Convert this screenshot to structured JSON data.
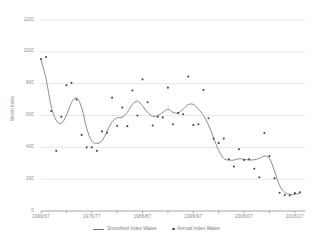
{
  "chart_data": {
    "type": "line",
    "title": "",
    "xlabel": "",
    "ylabel": "Welsh Index",
    "ylim": [
      0,
      1200
    ],
    "ytick_labels": [
      "1200",
      "1000",
      "800",
      "600",
      "400",
      "200",
      "0"
    ],
    "ytick_values": [
      1200,
      1000,
      800,
      600,
      400,
      200,
      0
    ],
    "xtick_labels": [
      "1966/67",
      "1976/77",
      "1986/87",
      "1996/97",
      "2006/07",
      "2016/17"
    ],
    "xtick_values": [
      1966,
      1976,
      1986,
      1996,
      2006,
      2016
    ],
    "xlim": [
      1966,
      2018
    ],
    "grid": "horizontal",
    "legend_position": "bottom",
    "series": [
      {
        "name": "Annual Index Wales",
        "marker": "dot",
        "color": "#4a4a4a",
        "x": [
          1966,
          1967,
          1968,
          1969,
          1970,
          1971,
          1972,
          1973,
          1974,
          1975,
          1976,
          1977,
          1978,
          1979,
          1980,
          1981,
          1982,
          1983,
          1984,
          1985,
          1986,
          1987,
          1988,
          1989,
          1990,
          1991,
          1992,
          1993,
          1994,
          1995,
          1996,
          1997,
          1998,
          1999,
          2000,
          2001,
          2002,
          2003,
          2004,
          2005,
          2006,
          2007,
          2008,
          2009,
          2010,
          2011,
          2012,
          2013,
          2014,
          2015,
          2016,
          2017
        ],
        "values": [
          955,
          968,
          628,
          378,
          592,
          790,
          805,
          700,
          478,
          400,
          400,
          378,
          500,
          492,
          712,
          535,
          650,
          533,
          757,
          600,
          827,
          683,
          537,
          592,
          588,
          775,
          545,
          615,
          608,
          845,
          540,
          545,
          760,
          583,
          455,
          428,
          455,
          325,
          280,
          388,
          320,
          325,
          265,
          212,
          490,
          345,
          205,
          115,
          100,
          98,
          112,
          118
        ]
      },
      {
        "name": "Smoothed Index Wales",
        "marker": "line",
        "color": "#6e6e6e",
        "x": [
          1966,
          1967,
          1968,
          1969,
          1970,
          1971,
          1972,
          1973,
          1974,
          1975,
          1976,
          1977,
          1978,
          1979,
          1980,
          1981,
          1982,
          1983,
          1984,
          1985,
          1986,
          1987,
          1988,
          1989,
          1990,
          1991,
          1992,
          1993,
          1994,
          1995,
          1996,
          1997,
          1998,
          1999,
          2000,
          2001,
          2002,
          2003,
          2004,
          2005,
          2006,
          2007,
          2008,
          2009,
          2010,
          2011,
          2012,
          2013,
          2014,
          2015,
          2016,
          2017
        ],
        "values": [
          950,
          830,
          660,
          570,
          550,
          600,
          680,
          710,
          650,
          520,
          440,
          425,
          440,
          500,
          560,
          585,
          590,
          620,
          670,
          690,
          660,
          620,
          595,
          600,
          620,
          640,
          620,
          615,
          640,
          668,
          670,
          640,
          600,
          540,
          460,
          380,
          330,
          320,
          320,
          328,
          325,
          320,
          322,
          330,
          345,
          330,
          250,
          160,
          118,
          105,
          105,
          112
        ]
      }
    ]
  },
  "legend": {
    "items": [
      {
        "label": "Smoothed Index Wales",
        "type": "line"
      },
      {
        "label": "Annual Index Wales",
        "type": "dot"
      }
    ]
  },
  "axis": {
    "y_title": "Welsh Index"
  }
}
